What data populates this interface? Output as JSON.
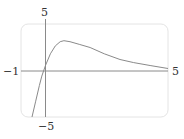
{
  "chart_data": {
    "type": "line",
    "title": "",
    "xlabel": "",
    "ylabel": "",
    "xlim": [
      -1,
      5
    ],
    "ylim": [
      -5,
      5
    ],
    "grid": false,
    "legend": null,
    "tick_labels": {
      "x_min": "−1",
      "x_max": "5",
      "y_max": "5",
      "y_min": "−5"
    },
    "series": [
      {
        "name": "f(x)",
        "x": [
          -0.55,
          -0.4,
          -0.25,
          -0.15,
          0.0,
          0.2,
          0.4,
          0.6,
          0.75,
          1.0,
          1.4,
          1.82,
          2.4,
          3.04,
          3.6,
          4.27,
          5.0
        ],
        "y": [
          -5.0,
          -3.3,
          -1.6,
          -0.6,
          0.55,
          1.8,
          2.65,
          3.1,
          3.2,
          3.1,
          2.8,
          2.47,
          1.8,
          1.18,
          0.85,
          0.54,
          0.22
        ]
      }
    ],
    "colors": {
      "curve": "#8a8a8a",
      "axes": "#8a8a8a",
      "frame": "#e4e4e4"
    }
  }
}
